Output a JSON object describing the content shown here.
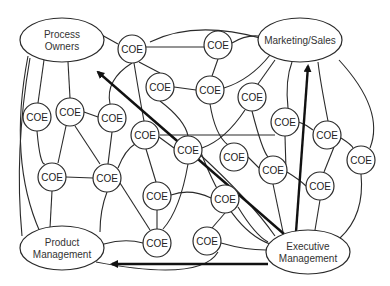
{
  "diagram": {
    "type": "network",
    "stakeholders": [
      {
        "id": "po",
        "lines": [
          "Process",
          "Owners"
        ],
        "cx": 62,
        "cy": 40,
        "rx": 42,
        "ry": 22
      },
      {
        "id": "ms",
        "lines": [
          "Marketing/Sales"
        ],
        "cx": 300,
        "cy": 40,
        "rx": 42,
        "ry": 22
      },
      {
        "id": "pm",
        "lines": [
          "Product",
          "Management"
        ],
        "cx": 62,
        "cy": 248,
        "rx": 42,
        "ry": 22
      },
      {
        "id": "em",
        "lines": [
          "Executive",
          "Management"
        ],
        "cx": 308,
        "cy": 252,
        "rx": 42,
        "ry": 22
      }
    ],
    "coe_label": "COE",
    "coe_nodes": [
      [
        132,
        49
      ],
      [
        218,
        45
      ],
      [
        160,
        87
      ],
      [
        210,
        90
      ],
      [
        252,
        97
      ],
      [
        285,
        122
      ],
      [
        327,
        135
      ],
      [
        37,
        117
      ],
      [
        70,
        112
      ],
      [
        112,
        118
      ],
      [
        145,
        135
      ],
      [
        188,
        150
      ],
      [
        234,
        157
      ],
      [
        273,
        170
      ],
      [
        361,
        160
      ],
      [
        320,
        186
      ],
      [
        52,
        177
      ],
      [
        107,
        178
      ],
      [
        157,
        196
      ],
      [
        225,
        199
      ],
      [
        157,
        243
      ],
      [
        207,
        241
      ]
    ],
    "arrows": [
      {
        "from": "Executive Management",
        "to": "Process Owners"
      },
      {
        "from": "Executive Management",
        "to": "Marketing/Sales"
      },
      {
        "from": "Executive Management",
        "to": "Product Management"
      }
    ]
  }
}
